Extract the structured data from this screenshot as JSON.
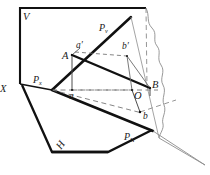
{
  "figure": {
    "type": "descriptive-geometry-projection-diagram",
    "title": "",
    "background_color": "#ffffff",
    "stroke_color": "#1a1a1a",
    "thin_color": "#4a4a4a",
    "dash_color": "#6b6b6b",
    "width": 210,
    "height": 175
  },
  "labels": {
    "v_plane": "V",
    "h_plane": "H",
    "p_v": {
      "base": "P",
      "sub": "v"
    },
    "p_h": {
      "base": "P",
      "sub": "H"
    },
    "p_x": {
      "base": "P",
      "sub": "x"
    },
    "axis_x": "X",
    "point_A": "A",
    "point_a_prime": "a′",
    "point_a": "a",
    "point_B": "B",
    "point_b_prime": "b′",
    "point_b": "b",
    "origin_O": "O"
  },
  "geometry": {
    "v_plane_rect": "20,8 146,8 146,58 20,58",
    "h_plane_outline": "22,86 58,74 152,120 108,152 52,152",
    "trace_pv": "52,90 130,18",
    "trace_ph": "52,90 152,132",
    "point_coords": {
      "A": [
        72,
        55
      ],
      "a": [
        72,
        90
      ],
      "a_prime": [
        74,
        50
      ],
      "b_prime": [
        128,
        53
      ],
      "B": [
        150,
        88
      ],
      "O": [
        132,
        90
      ],
      "b": [
        140,
        112
      ]
    }
  }
}
